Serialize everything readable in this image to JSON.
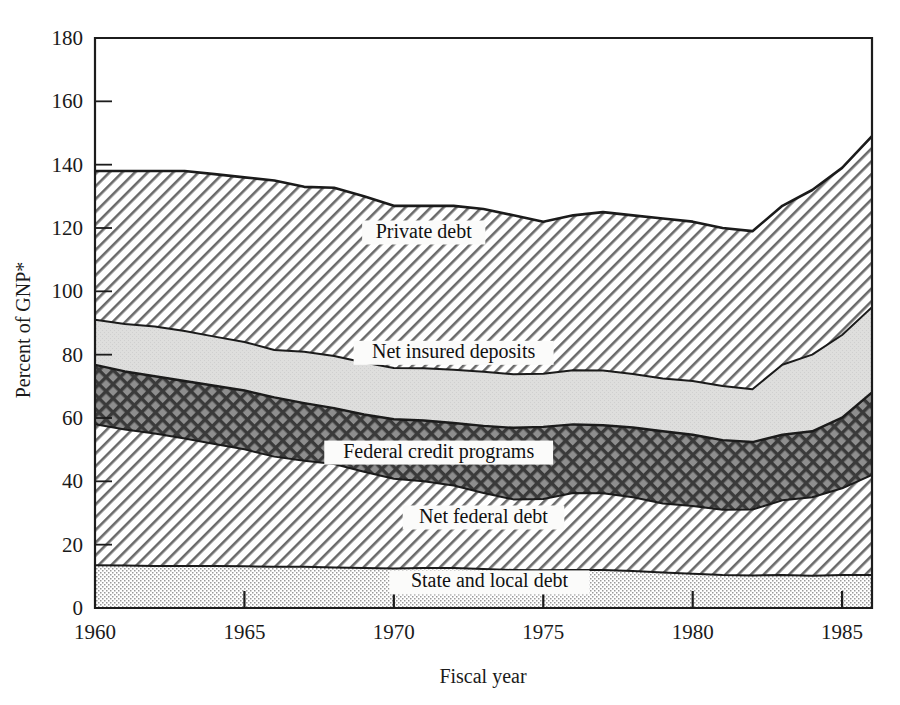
{
  "figure": {
    "background_color": "#ffffff",
    "line_color": "#1b1b1b"
  },
  "chart_data": {
    "type": "area",
    "title": "",
    "subtitle": "",
    "xlabel": "Fiscal year",
    "ylabel": "Percent of GNP*",
    "xlim": [
      1960,
      1986
    ],
    "ylim": [
      0,
      180
    ],
    "grid": false,
    "legend_position": "inline-labels",
    "stacked": true,
    "x": [
      1960,
      1961,
      1962,
      1963,
      1964,
      1965,
      1966,
      1967,
      1968,
      1969,
      1970,
      1971,
      1972,
      1973,
      1974,
      1975,
      1976,
      1977,
      1978,
      1979,
      1980,
      1981,
      1982,
      1983,
      1984,
      1985,
      1986
    ],
    "xticks": [
      1960,
      1965,
      1970,
      1975,
      1980,
      1985
    ],
    "xticklabels": [
      "1960",
      "1965",
      "1970",
      "1975",
      "1980",
      "1985"
    ],
    "yticks": [
      0,
      20,
      40,
      60,
      80,
      100,
      120,
      140,
      160,
      180
    ],
    "yticklabels": [
      "0",
      "20",
      "40",
      "60",
      "80",
      "100",
      "120",
      "140",
      "160",
      "180"
    ],
    "series": [
      {
        "name": "State and local debt",
        "label": "State and local debt",
        "fill": "fine-dot",
        "label_x": 1973.2,
        "label_y": 6.5,
        "values": [
          13.5,
          13.4,
          13.3,
          13.3,
          13.3,
          13.2,
          13.0,
          13.0,
          12.8,
          12.6,
          12.5,
          12.6,
          12.6,
          12.3,
          12.0,
          11.9,
          12.0,
          12.0,
          11.7,
          11.2,
          10.8,
          10.4,
          10.3,
          10.4,
          10.2,
          10.4,
          10.4
        ]
      },
      {
        "name": "Net federal debt",
        "label": "Net federal debt",
        "fill": "diagonal-hatch-light",
        "label_x": 1973.0,
        "label_y": 27.0,
        "values": [
          44.5,
          43.0,
          41.8,
          40.2,
          38.5,
          36.9,
          34.8,
          33.5,
          32.7,
          30.4,
          28.3,
          27.4,
          26.1,
          24.0,
          22.3,
          22.5,
          24.3,
          24.2,
          23.3,
          21.8,
          21.4,
          20.6,
          20.8,
          23.6,
          24.8,
          27.4,
          31.6
        ]
      },
      {
        "name": "Federal credit programs",
        "label": "Federal credit programs",
        "fill": "cross-hatch-dark",
        "label_x": 1971.5,
        "label_y": 47.5,
        "values": [
          18.8,
          18.3,
          18.1,
          18.2,
          18.4,
          18.6,
          18.7,
          18.2,
          17.6,
          18.1,
          18.8,
          19.2,
          19.7,
          21.2,
          22.6,
          22.8,
          21.7,
          21.5,
          22.0,
          22.8,
          22.5,
          22.0,
          21.3,
          20.7,
          20.8,
          22.3,
          26.1
        ]
      },
      {
        "name": "Net insured deposits",
        "label": "Net insured deposits",
        "fill": "light-gray",
        "label_x": 1972.0,
        "label_y": 79.0,
        "values": [
          14.2,
          15.0,
          15.7,
          15.8,
          15.5,
          15.3,
          15.0,
          16.2,
          16.5,
          16.4,
          16.2,
          16.5,
          16.8,
          17.1,
          16.9,
          16.8,
          17.1,
          17.3,
          16.9,
          16.7,
          17.0,
          17.1,
          16.7,
          22.1,
          24.2,
          26.1,
          26.9
        ]
      },
      {
        "name": "Private debt",
        "label": "Private debt",
        "fill": "diagonal-hatch-light",
        "label_x": 1971.0,
        "label_y": 117.0,
        "values": [
          47.0,
          48.3,
          49.1,
          50.5,
          51.3,
          52.0,
          53.5,
          52.1,
          53.1,
          52.5,
          51.2,
          51.3,
          51.8,
          51.4,
          50.2,
          48.0,
          48.9,
          50.0,
          50.1,
          50.5,
          50.3,
          49.9,
          49.9,
          50.2,
          52.0,
          52.8,
          54.0
        ]
      }
    ],
    "totals": [
      138.0,
      138.0,
      138.0,
      138.0,
      137.0,
      136.0,
      135.0,
      133.0,
      132.7,
      130.0,
      127.0,
      127.0,
      127.0,
      126.0,
      124.0,
      122.0,
      124.0,
      125.0,
      124.0,
      123.0,
      122.0,
      120.0,
      119.0,
      127.0,
      132.0,
      139.0,
      149.0
    ]
  },
  "annotations": {
    "footnote_marker": "*"
  }
}
